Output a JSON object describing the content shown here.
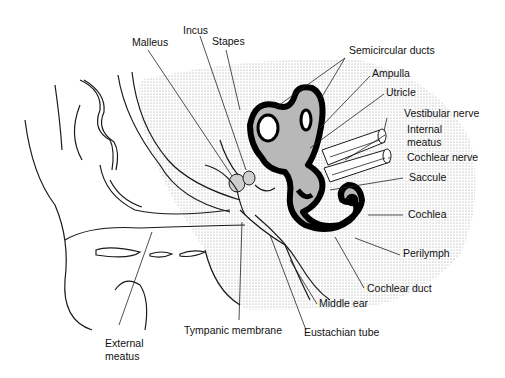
{
  "diagram": {
    "labels": {
      "malleus": "Malleus",
      "incus": "Incus",
      "stapes": "Stapes",
      "semicircular_ducts": "Semicircular ducts",
      "ampulla": "Ampulla",
      "utricle": "Utricle",
      "vestibular_nerve": "Vestibular nerve",
      "internal_meatus_1": "Internal",
      "internal_meatus_2": "meatus",
      "cochlear_nerve": "Cochlear nerve",
      "saccule": "Saccule",
      "cochlea": "Cochlea",
      "perilymph": "Perilymph",
      "cochlear_duct": "Cochlear duct",
      "middle_ear": "Middle ear",
      "eustachian_tube": "Eustachian tube",
      "tympanic_membrane": "Tympanic membrane",
      "external_meatus_1": "External",
      "external_meatus_2": "meatus"
    },
    "colors": {
      "stipple": "#d9d9d9",
      "labyrinth_fill": "#b8b8b8",
      "labyrinth_wall": "#000000",
      "ink": "#1a1a1a"
    }
  }
}
